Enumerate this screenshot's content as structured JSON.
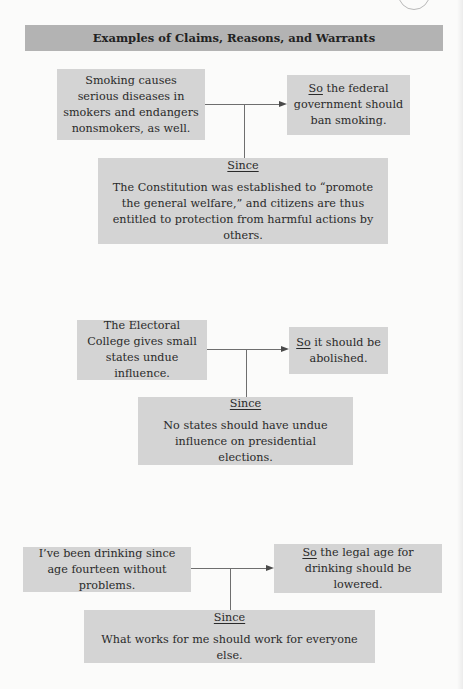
{
  "page": {
    "title": "Examples of Claims, Reasons, and Warrants",
    "colors": {
      "header_bg": "#b3b3b3",
      "box_bg": "#d4d4d4",
      "page_bg": "#fbfbfa",
      "connector": "#6e6e6e"
    }
  },
  "examples": [
    {
      "reason": "Smoking causes serious diseases in smokers and endangers nonsmokers, as well.",
      "claim_prefix": "So",
      "claim_rest": " the federal government should ban smoking.",
      "warrant_label": "Since",
      "warrant": "The Constitution was established to “promote the general welfare,” and citizens are thus entitled to protection from harmful actions by others."
    },
    {
      "reason": "The Electoral College gives small states undue influence.",
      "claim_prefix": "So",
      "claim_rest": " it should be abolished.",
      "warrant_label": "Since",
      "warrant": "No states should have undue influence on presidential elections."
    },
    {
      "reason": "I’ve been drinking since age fourteen without problems.",
      "claim_prefix": "So",
      "claim_rest": " the legal age for drinking should be lowered.",
      "warrant_label": "Since",
      "warrant": "What works for me should work for everyone else."
    }
  ]
}
